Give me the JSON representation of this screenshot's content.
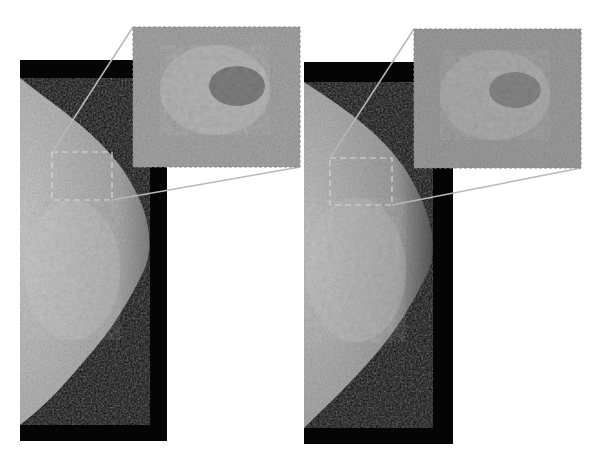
{
  "figure": {
    "panels": [
      {
        "id": "left",
        "label": "original",
        "tissue_shade": "#9a9a9a",
        "inset_shade": "#a4a4a4"
      },
      {
        "id": "right",
        "label": "processed",
        "tissue_shade": "#8e8e8e",
        "inset_shade": "#9c9c9c"
      }
    ],
    "colors": {
      "background": "#ffffff",
      "film": "#050505",
      "callout": "#b8b8b8",
      "roi": "#d8d8d8"
    }
  }
}
